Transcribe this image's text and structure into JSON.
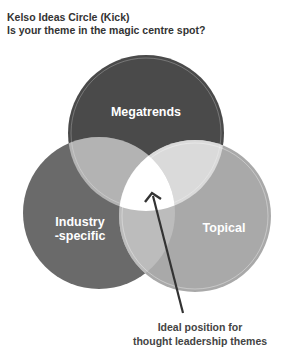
{
  "header": {
    "title": "Kelso Ideas Circle (Kick)",
    "subtitle": "Is your theme in the magic centre spot?"
  },
  "diagram": {
    "type": "venn",
    "circles": [
      {
        "label": "Megatrends",
        "color": "#4a4a4a"
      },
      {
        "label_line1": "Industry",
        "label_line2": "-specific",
        "color": "#6a6a6a"
      },
      {
        "label": "Topical",
        "color": "#a8a8a8"
      }
    ],
    "overlap_colors": {
      "megatrends_industry": "#b4b4b4",
      "megatrends_topical": "#dcdcdc",
      "industry_topical": "#bdbdbd",
      "center": "#ffffff"
    },
    "annotation": {
      "line1": "Ideal position for",
      "line2": "thought leadership themes"
    }
  }
}
